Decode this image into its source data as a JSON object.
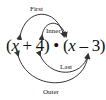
{
  "diagram": {
    "type": "FOIL method diagram",
    "expression": {
      "open1": "(",
      "var1": "x",
      "op1": " + 4)",
      "dot": " • ",
      "open2": "(",
      "var2": "x",
      "op2": " – 3)"
    },
    "labels": {
      "first": "First",
      "inner": "Inner",
      "last": "Last",
      "outer": "Outer"
    },
    "colors": {
      "stroke": "#333333",
      "text": "#111111"
    }
  }
}
